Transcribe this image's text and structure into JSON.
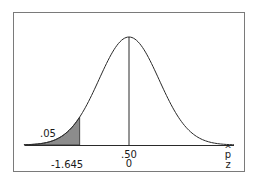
{
  "chart_data": {
    "type": "area",
    "title": "",
    "xlabel_top": "p̂",
    "xlabel_bottom": "z",
    "shaded_region": {
      "tail": "left",
      "area_label": ".05",
      "area": 0.05,
      "critical_value_label": "-1.645",
      "critical_value": -1.645
    },
    "center": {
      "phat_label": ".50",
      "phat": 0.5,
      "z_label": "0",
      "z": 0
    },
    "x_range_z": [
      -3.5,
      3.5
    ],
    "grid": false,
    "legend": null
  },
  "labels": {
    "tail_area": ".05",
    "critical_z": "-1.645",
    "center_phat": ".50",
    "center_z": "0",
    "axis_phat": "p",
    "axis_phat_hat": "^",
    "axis_z": "z"
  },
  "colors": {
    "frame": "#7a7a7a",
    "curve": "#2a2a2a",
    "shade": "#8c8c8c",
    "axis": "#2a2a2a"
  }
}
